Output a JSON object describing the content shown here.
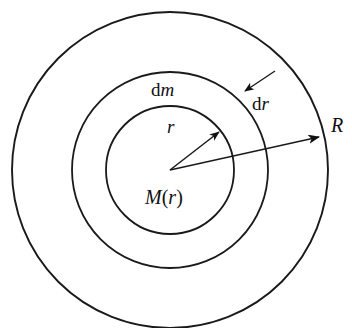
{
  "figure": {
    "kind": "concentric-shell-diagram",
    "background_color": "#ffffff",
    "stroke_color": "#1a1a1a",
    "width": 352,
    "height": 328,
    "center": {
      "x": 170,
      "y": 170
    }
  },
  "circles": [
    {
      "name": "outer-sphere-surface",
      "radius": 158,
      "label_ref": "R"
    },
    {
      "name": "shell-outer-edge",
      "radius": 98,
      "label_ref": "dm"
    },
    {
      "name": "inner-mass-boundary",
      "radius": 64,
      "label_ref": "r"
    }
  ],
  "labels": {
    "dm": {
      "upright": "d",
      "italic": "m",
      "x": 151,
      "y": 96
    },
    "dr": {
      "upright": "d",
      "italic": "r",
      "x": 252,
      "y": 110
    },
    "r": {
      "italic": "r",
      "x": 167,
      "y": 133
    },
    "R": {
      "italic": "R",
      "x": 331,
      "y": 132
    },
    "M_of_r": {
      "italic_m": "M",
      "paren_open": "(",
      "italic_r": "r",
      "paren_close": ")",
      "x": 145,
      "y": 204
    }
  },
  "arrows": [
    {
      "name": "radius-r-arrow",
      "from": {
        "x": 170,
        "y": 170
      },
      "to": {
        "x": 219,
        "y": 132
      },
      "label_ref": "r"
    },
    {
      "name": "radius-R-arrow",
      "from": {
        "x": 170,
        "y": 170
      },
      "to": {
        "x": 319,
        "y": 137
      },
      "label_ref": "R"
    },
    {
      "name": "thickness-dr-arrow",
      "from": {
        "x": 275,
        "y": 71
      },
      "to": {
        "x": 245,
        "y": 91
      },
      "label_ref": "dr"
    }
  ]
}
